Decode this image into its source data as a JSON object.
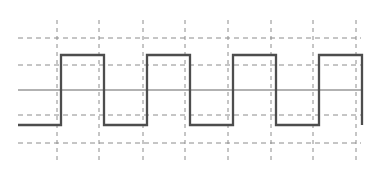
{
  "figure": {
    "width": 379,
    "height": 177,
    "background": "#ffffff",
    "title": "",
    "caption": ""
  },
  "colors": {
    "signal": "#4d4d4d",
    "gridline": "#8c8c8c",
    "axis": "#999999",
    "background": "#ffffff"
  },
  "chart_data": {
    "type": "line",
    "title": "",
    "subtitle": "",
    "xlabel": "",
    "ylabel": "",
    "waveform": "square",
    "duty_cycle_percent": 50,
    "periods_shown": 4,
    "high_level": 1,
    "low_level": -1,
    "zero_level": 0,
    "legend": [],
    "legend_position": "none",
    "grid": true,
    "grid_style": "dashed",
    "xlim": [
      0,
      8
    ],
    "ylim": [
      -2,
      2
    ],
    "x_ticks": [
      1,
      2,
      3,
      4,
      5,
      6,
      7,
      8
    ],
    "x_tick_labels": [
      "",
      "",
      "",
      "",
      "",
      "",
      "",
      ""
    ],
    "y_ticks": [
      -2,
      -1,
      0,
      1,
      2
    ],
    "y_tick_labels": [
      "",
      "",
      "",
      "",
      ""
    ],
    "series": [
      {
        "name": "square-wave",
        "x": [
          0.0,
          1.0,
          1.0,
          2.0,
          2.0,
          3.0,
          3.0,
          4.0,
          4.0,
          5.0,
          5.0,
          6.0,
          6.0,
          7.0,
          7.0,
          8.0,
          8.0
        ],
        "y": [
          -1,
          -1,
          1,
          1,
          -1,
          -1,
          1,
          1,
          -1,
          -1,
          1,
          1,
          -1,
          -1,
          1,
          1,
          -1
        ]
      }
    ]
  },
  "geometry": {
    "plot_left": 18,
    "plot_right": 362,
    "plot_top": 20,
    "plot_bottom": 160,
    "grid_x": [
      57,
      99,
      143,
      185,
      228,
      271,
      313,
      356
    ],
    "grid_y": [
      38,
      65,
      90,
      115,
      143
    ],
    "axis_y": 90,
    "high_y": 65,
    "low_y": 115,
    "wave_start_x": 18,
    "wave_end_x": 356
  }
}
